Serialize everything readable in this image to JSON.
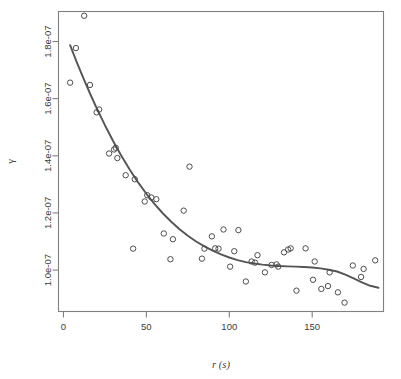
{
  "chart_data": {
    "type": "scatter",
    "title": "",
    "subtitle": "",
    "xlabel": "r (s)",
    "ylabel": "γ",
    "xlim": [
      -3,
      193
    ],
    "ylim": [
      8.55e-08,
      1.905e-07
    ],
    "grid": false,
    "legend": null,
    "x_ticks": [
      0,
      50,
      100,
      150
    ],
    "x_tick_labels": [
      "0",
      "50",
      "100",
      "150"
    ],
    "y_ticks": [
      1e-07,
      1.2e-07,
      1.4e-07,
      1.6e-07,
      1.8e-07
    ],
    "y_tick_labels": [
      "1.0e-07",
      "1.2e-07",
      "1.4e-07",
      "1.6e-07",
      "1.8e-07"
    ],
    "point_marker": "open-circle",
    "point_color": "#4d4d4d",
    "line_color": "#555555",
    "frame_color": "#808080",
    "background": "#ffffff",
    "series": [
      {
        "name": "observations",
        "type": "scatter",
        "x": [
          4.0,
          7.5,
          12.5,
          16.0,
          20.0,
          21.5,
          27.5,
          30.5,
          31.5,
          32.5,
          37.5,
          42.0,
          43.0,
          49.0,
          50.5,
          53.0,
          56.0,
          60.5,
          64.5,
          66.0,
          72.5,
          76.0,
          83.5,
          85.0,
          89.5,
          91.5,
          93.5,
          96.5,
          100.5,
          103.0,
          105.5,
          110.0,
          113.5,
          115.5,
          117.0,
          121.5,
          125.5,
          128.5,
          129.5,
          133.0,
          135.5,
          137.0,
          140.5,
          146.0,
          150.5,
          151.5,
          155.5,
          159.5,
          160.5,
          165.5,
          169.5,
          174.5,
          179.5,
          181.0,
          188.0
        ],
        "y": [
          1.656e-07,
          1.777e-07,
          1.89e-07,
          1.648e-07,
          1.552e-07,
          1.562e-07,
          1.408e-07,
          1.422e-07,
          1.428e-07,
          1.392e-07,
          1.332e-07,
          1.075e-07,
          1.318e-07,
          1.24e-07,
          1.262e-07,
          1.254e-07,
          1.248e-07,
          1.128e-07,
          1.038e-07,
          1.108e-07,
          1.208e-07,
          1.362e-07,
          1.04e-07,
          1.075e-07,
          1.118e-07,
          1.076e-07,
          1.075e-07,
          1.142e-07,
          1.012e-07,
          1.066e-07,
          1.14e-07,
          9.6e-08,
          1.03e-07,
          1.026e-07,
          1.052e-07,
          9.92e-08,
          1.018e-07,
          1.02e-07,
          1.012e-07,
          1.062e-07,
          1.072e-07,
          1.076e-07,
          9.28e-08,
          1.076e-07,
          9.66e-08,
          1.03e-07,
          9.34e-08,
          9.44e-08,
          9.92e-08,
          9.22e-08,
          8.86e-08,
          1.016e-07,
          9.76e-08,
          1.004e-07,
          1.034e-07
        ],
        "comment": "empirical variogram cloud points"
      },
      {
        "name": "fitted-curve",
        "type": "line",
        "x": [
          4.0,
          8.0,
          12.0,
          16.0,
          20.0,
          25.0,
          30.0,
          35.0,
          40.0,
          45.0,
          50.0,
          55.0,
          60.0,
          65.0,
          70.0,
          75.0,
          80.0,
          85.0,
          90.0,
          95.0,
          100.0,
          105.0,
          110.0,
          115.0,
          120.0,
          125.0,
          130.0,
          135.0,
          140.0,
          145.0,
          150.0,
          155.0,
          160.0,
          165.0,
          170.0,
          175.0,
          180.0,
          185.0,
          190.0
        ],
        "y": [
          1.787e-07,
          1.728e-07,
          1.672e-07,
          1.618e-07,
          1.567e-07,
          1.507e-07,
          1.451e-07,
          1.399e-07,
          1.351e-07,
          1.307e-07,
          1.267e-07,
          1.231e-07,
          1.198e-07,
          1.169e-07,
          1.143e-07,
          1.12e-07,
          1.1e-07,
          1.083e-07,
          1.068e-07,
          1.055e-07,
          1.044e-07,
          1.035e-07,
          1.028e-07,
          1.023e-07,
          1.019e-07,
          1.016e-07,
          1.014e-07,
          1.013e-07,
          1.012e-07,
          1.011e-07,
          1.009e-07,
          1.006e-07,
          1.001e-07,
          9.95e-08,
          9.84e-08,
          9.71e-08,
          9.57e-08,
          9.45e-08,
          9.38e-08
        ],
        "comment": "smoothed variogram model fit"
      }
    ]
  }
}
